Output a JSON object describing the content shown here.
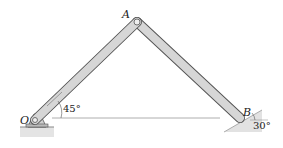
{
  "diagram": {
    "type": "mechanism",
    "points": {
      "O": {
        "label": "O"
      },
      "A": {
        "label": "A"
      },
      "B": {
        "label": "B"
      }
    },
    "angles": {
      "OA": {
        "label": "45°"
      },
      "incline": {
        "label": "30°"
      }
    },
    "colors": {
      "bar_fill": "#d6d6d6",
      "bar_stroke": "#555555",
      "ground": "#e0e0e0",
      "line": "#777777"
    }
  }
}
